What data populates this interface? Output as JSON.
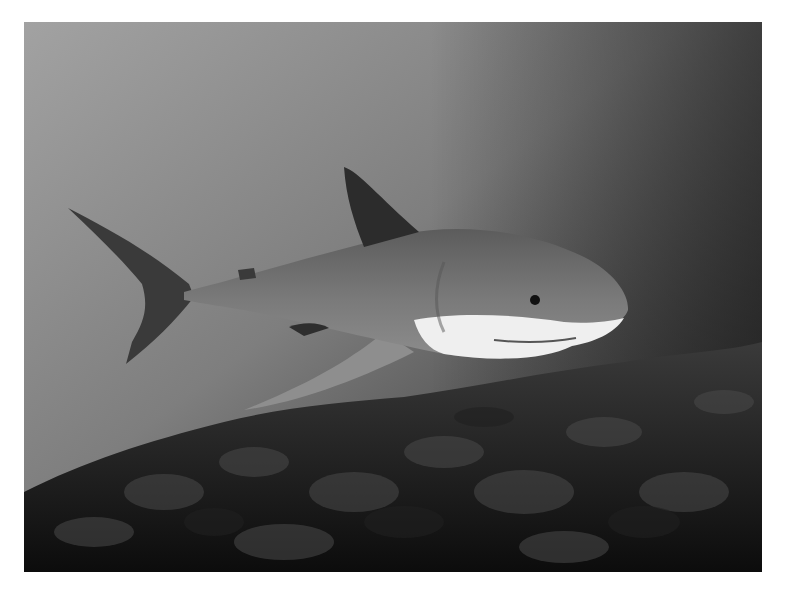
{
  "image": {
    "subject": "Great white shark swimming over kelp reef",
    "style": "grayscale underwater photograph",
    "colors": {
      "page_background": "#ffffff",
      "water_top_left": "#a4a4a4",
      "water_top_right": "#3c3c3c",
      "water_bottom": "#2a2a2a",
      "kelp_dark": "#141414",
      "kelp_light": "#3a3a3a",
      "shark_dorsal": "#5a5a5a",
      "shark_fin_dark": "#2c2c2c",
      "shark_belly": "#efefef"
    }
  }
}
